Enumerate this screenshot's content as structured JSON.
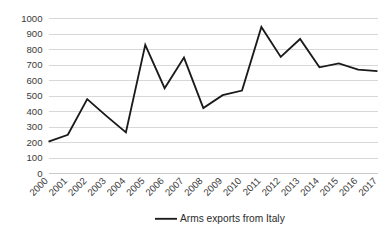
{
  "chart_data": {
    "type": "line",
    "title": "",
    "subtitle": "",
    "xlabel": "",
    "ylabel": "",
    "categories": [
      "2000",
      "2001",
      "2002",
      "2003",
      "2004",
      "2005",
      "2006",
      "2007",
      "2008",
      "2009",
      "2010",
      "2011",
      "2012",
      "2013",
      "2014",
      "2015",
      "2016",
      "2017"
    ],
    "series": [
      {
        "name": "Arms exports from Italy",
        "color": "#1a1a1a",
        "values": [
          205,
          250,
          480,
          370,
          265,
          830,
          550,
          748,
          422,
          505,
          535,
          945,
          752,
          868,
          685,
          710,
          670,
          660
        ]
      }
    ],
    "ylim": [
      0,
      1000
    ],
    "ytick_labels": [
      "0",
      "100",
      "200",
      "300",
      "400",
      "500",
      "600",
      "700",
      "800",
      "900",
      "1000"
    ],
    "ytick_values": [
      0,
      100,
      200,
      300,
      400,
      500,
      600,
      700,
      800,
      900,
      1000
    ],
    "grid": "horizontal",
    "grid_color": "#d4d4d4",
    "legend_position": "bottom-center",
    "legend_entries": [
      "Arms exports from Italy"
    ],
    "xtick_rotation": -45,
    "markers": false,
    "annotations": []
  },
  "legend": {
    "entry_label": "Arms exports from Italy",
    "marker_name": "line-swatch"
  },
  "axes": {
    "y_axis_name": "value-axis",
    "x_axis_name": "year-axis"
  }
}
